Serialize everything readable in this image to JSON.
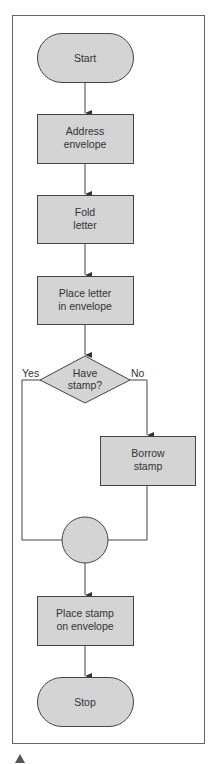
{
  "colors": {
    "shape_fill": "#d4d4d4",
    "stroke": "#444444",
    "frame": "#666666",
    "text": "#333333",
    "marker": "#555555"
  },
  "flowchart": {
    "start": {
      "label": "Start"
    },
    "steps": [
      {
        "line1": "Address",
        "line2": "envelope"
      },
      {
        "line1": "Fold",
        "line2": "letter"
      },
      {
        "line1": "Place letter",
        "line2": "in envelope"
      }
    ],
    "decision": {
      "line1": "Have",
      "line2": "stamp?",
      "yes_label": "Yes",
      "no_label": "No"
    },
    "branch": {
      "line1": "Borrow",
      "line2": "stamp"
    },
    "final_step": {
      "line1": "Place stamp",
      "line2": "on envelope"
    },
    "stop": {
      "label": "Stop"
    }
  },
  "footer": {
    "marker": "▲"
  }
}
